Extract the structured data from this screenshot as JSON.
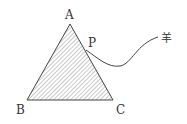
{
  "diagram": {
    "points": {
      "A": {
        "label": "A",
        "x": 70,
        "y": 24
      },
      "B": {
        "label": "B",
        "x": 27,
        "y": 100
      },
      "C": {
        "label": "C",
        "x": 113,
        "y": 100
      },
      "P": {
        "label": "P",
        "x": 86,
        "y": 50
      }
    },
    "rope_end_label": "羊",
    "colors": {
      "stroke": "#444444",
      "hatch": "#666666",
      "text": "#333333"
    }
  }
}
